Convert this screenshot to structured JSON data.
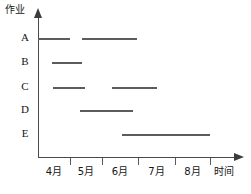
{
  "chart_data": {
    "type": "bar",
    "orientation": "horizontal",
    "title": "",
    "xlabel": "时间",
    "ylabel": "作业",
    "grid": false,
    "legend": false,
    "x_tick_labels": [
      "4月",
      "5月",
      "6月",
      "7月",
      "8月"
    ],
    "x_tick_positions_px": [
      70,
      102,
      138,
      175,
      210
    ],
    "axis_origin_px": {
      "x": 38,
      "y": 157
    },
    "categories": [
      "A",
      "B",
      "C",
      "D",
      "E"
    ],
    "series": [
      {
        "name": "A",
        "row": 0,
        "y_px": 38,
        "bars": [
          {
            "start_px": 38,
            "end_px": 70,
            "start_label": "3月末",
            "end_label": "4月"
          },
          {
            "start_px": 82,
            "end_px": 137,
            "start_label": "5月初",
            "end_label": "6月"
          }
        ]
      },
      {
        "name": "B",
        "row": 1,
        "y_px": 62,
        "bars": [
          {
            "start_px": 52,
            "end_px": 82,
            "start_label": "4月初",
            "end_label": "5月初"
          }
        ]
      },
      {
        "name": "C",
        "row": 2,
        "y_px": 87,
        "bars": [
          {
            "start_px": 53,
            "end_px": 85,
            "start_label": "4月初",
            "end_label": "5月初"
          },
          {
            "start_px": 112,
            "end_px": 157,
            "start_label": "5月中",
            "end_label": "6月末"
          }
        ]
      },
      {
        "name": "D",
        "row": 3,
        "y_px": 110,
        "bars": [
          {
            "start_px": 80,
            "end_px": 133,
            "start_label": "5月初",
            "end_label": "6月"
          }
        ]
      },
      {
        "name": "E",
        "row": 4,
        "y_px": 134,
        "bars": [
          {
            "start_px": 122,
            "end_px": 210,
            "start_label": "5月末",
            "end_label": "8月"
          }
        ]
      }
    ],
    "colors": {
      "bar": "#5c5c5c",
      "axis": "#4a4a4a",
      "text": "#161616",
      "background": "#ffffff"
    }
  },
  "axes": {
    "y_label": "作业",
    "x_label": "时间"
  },
  "row_labels": [
    "A",
    "B",
    "C",
    "D",
    "E"
  ],
  "tick_labels": [
    "4月",
    "5月",
    "6月",
    "7月",
    "8月"
  ]
}
